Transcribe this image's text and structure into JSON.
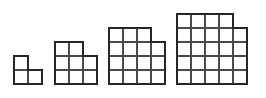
{
  "canvas": {
    "width": 266,
    "height": 98,
    "background_color": "#ffffff"
  },
  "style": {
    "grid_line_color": "#4a4a4a",
    "outline_color": "#262626",
    "cell_fill_color": "#ffffff",
    "grid_line_width": 1.1,
    "outline_width": 2.0
  },
  "chart_data": {
    "type": "diagram",
    "title": "",
    "subtitle": "",
    "xlabel": "",
    "ylabel": "",
    "categories": [
      "figure-1",
      "figure-2",
      "figure-3",
      "figure-4"
    ],
    "values": [
      3,
      8,
      15,
      24
    ],
    "series": [
      {
        "name": "grid size n",
        "values": [
          2,
          3,
          4,
          5
        ]
      },
      {
        "name": "cell count",
        "values": [
          3,
          8,
          15,
          24
        ]
      },
      {
        "name": "full square cells",
        "values": [
          4,
          9,
          16,
          25
        ]
      },
      {
        "name": "removed cells",
        "values": [
          1,
          1,
          1,
          1
        ]
      }
    ],
    "legend": [],
    "annotations": [],
    "grid": true,
    "legend_position": "none",
    "alignment": "bottom-aligned baseline",
    "missing_cell_position": "top-right",
    "cell_size_px": 14
  },
  "figures": [
    {
      "id": "figure-1",
      "label": "figure-1",
      "n": 2,
      "cell_count": 3,
      "x": 14,
      "y": 56,
      "cell": 14,
      "missing_cell": {
        "row": 0,
        "col": 1
      }
    },
    {
      "id": "figure-2",
      "label": "figure-2",
      "n": 3,
      "cell_count": 8,
      "x": 55,
      "y": 42,
      "cell": 14,
      "missing_cell": {
        "row": 0,
        "col": 2
      }
    },
    {
      "id": "figure-3",
      "label": "figure-3",
      "n": 4,
      "cell_count": 15,
      "x": 109,
      "y": 28,
      "cell": 14,
      "missing_cell": {
        "row": 0,
        "col": 3
      }
    },
    {
      "id": "figure-4",
      "label": "figure-4",
      "n": 5,
      "cell_count": 24,
      "x": 177,
      "y": 14,
      "cell": 14,
      "missing_cell": {
        "row": 0,
        "col": 4
      }
    }
  ]
}
